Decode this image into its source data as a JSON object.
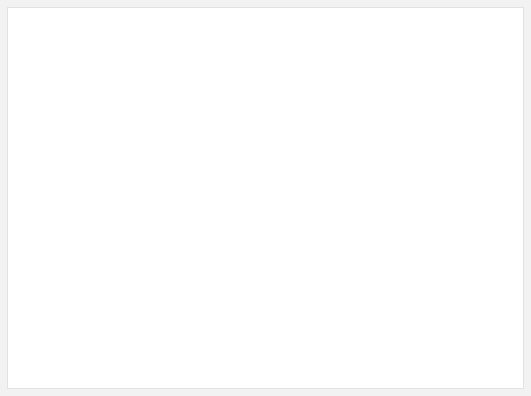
{
  "figure": {
    "background_color": "#ffffff",
    "frame_color": "#f2f2f2",
    "ink_color": "#231f20",
    "leader_line_color": "#231f20"
  },
  "captions": {
    "lateral": "Lateral View",
    "posterior": "Posterior View"
  },
  "labels": {
    "epiglottic_cartilage_line1": "Epiglottic",
    "epiglottic_cartilage_line2": "cartilage",
    "aryepiglottic_muscle": "Aryepiglottic muscle",
    "thyroepiglottic_muscle": "Thyroepiglottic muscle",
    "arytenoid_muscle_heading": "Arytenoid muscle:",
    "arytenoid_transverse": "Transverse",
    "arytenoid_oblique": "Oblique",
    "posterior_cricoarytenoid_line1": "Posterior",
    "posterior_cricoarytenoid_line2": "cricoarytenoid m.",
    "inferior_laryngeal_nerve": "Inferior laryngeal n.",
    "cricothyroid_joint": "Cricothyroid joint",
    "trachea": "Trachea",
    "recurrent_laryngeal_line1": "Recurrent",
    "recurrent_laryngeal_line2": "laryngea n.",
    "thyroarytenoid_muscle": "Thyroarytenoid m.",
    "lateral_cricoarytenoid_muscle": "Lateral cricoarytenoid m."
  },
  "views": {
    "lateral": {
      "name": "lateral-larynx-illustration",
      "structures": [
        "epiglottic cartilage",
        "aryepiglottic muscle",
        "thyroepiglottic muscle",
        "thyroid cartilage lamina",
        "cricoid cartilage",
        "thyroarytenoid muscle",
        "lateral cricoarytenoid muscle",
        "cricothyroid joint",
        "trachea",
        "recurrent laryngeal nerve"
      ]
    },
    "posterior": {
      "name": "posterior-larynx-illustration",
      "structures": [
        "epiglottic cartilage",
        "aryepiglottic muscle",
        "oblique arytenoid muscle",
        "transverse arytenoid muscle",
        "posterior cricoarytenoid muscle",
        "cricoid cartilage",
        "superior cornu of thyroid cartilage",
        "trachea",
        "inferior laryngeal nerve"
      ]
    }
  }
}
